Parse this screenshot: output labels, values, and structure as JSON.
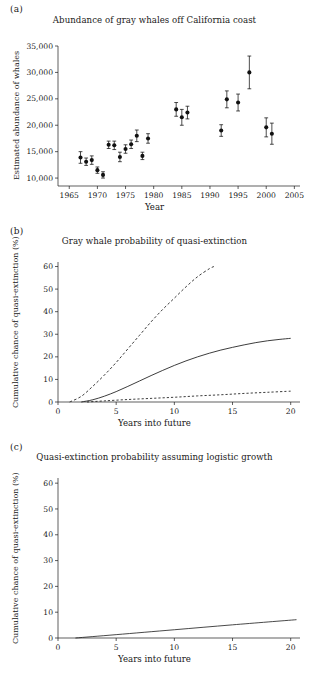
{
  "figure": {
    "panels": [
      {
        "tag": "(a)",
        "title": "Abundance of gray whales off California coast",
        "xlabel": "Year",
        "ylabel": "Estimated abundance of whales"
      },
      {
        "tag": "(b)",
        "title": "Gray whale probability of quasi-extinction",
        "xlabel": "Years into future",
        "ylabel": "Cumulative chance of quasi-extinction (%)"
      },
      {
        "tag": "(c)",
        "title": "Quasi-extinction probability assuming logistic growth",
        "xlabel": "Years into future",
        "ylabel": "Cumulative chance of quasi-extinction (%)"
      }
    ]
  },
  "chart_data": [
    {
      "type": "scatter",
      "panel": "(a)",
      "title": "Abundance of gray whales off California coast",
      "xlabel": "Year",
      "ylabel": "Estimated abundance of whales",
      "xlim": [
        1963,
        2006
      ],
      "ylim": [
        8500,
        35000
      ],
      "xticks": [
        1965,
        1970,
        1975,
        1980,
        1985,
        1990,
        1995,
        2000,
        2005
      ],
      "xticklabels": [
        "1965",
        "1970",
        "1975",
        "1980",
        "1985",
        "1990",
        "1995",
        "2000",
        "2005"
      ],
      "yticks": [
        10000,
        15000,
        20000,
        25000,
        30000,
        35000
      ],
      "yticklabels": [
        "10,000",
        "15,000",
        "20,000",
        "25,000",
        "30,000",
        "35,000"
      ],
      "grid": false,
      "legend": "none",
      "error_bars": "vertical, symmetric (95% CI)",
      "marker": "filled circle",
      "points": [
        {
          "x": 1967,
          "y": 13900,
          "yerr": 1100
        },
        {
          "x": 1968,
          "y": 13100,
          "yerr": 700
        },
        {
          "x": 1969,
          "y": 13400,
          "yerr": 800
        },
        {
          "x": 1970,
          "y": 11500,
          "yerr": 600
        },
        {
          "x": 1971,
          "y": 10600,
          "yerr": 600
        },
        {
          "x": 1972,
          "y": 16300,
          "yerr": 700
        },
        {
          "x": 1973,
          "y": 16200,
          "yerr": 800
        },
        {
          "x": 1974,
          "y": 14000,
          "yerr": 900
        },
        {
          "x": 1975,
          "y": 15500,
          "yerr": 800
        },
        {
          "x": 1976,
          "y": 16400,
          "yerr": 800
        },
        {
          "x": 1977,
          "y": 18000,
          "yerr": 1100
        },
        {
          "x": 1978,
          "y": 14200,
          "yerr": 700
        },
        {
          "x": 1979,
          "y": 17500,
          "yerr": 900
        },
        {
          "x": 1984,
          "y": 23000,
          "yerr": 1300
        },
        {
          "x": 1985,
          "y": 21500,
          "yerr": 1500
        },
        {
          "x": 1986,
          "y": 22400,
          "yerr": 1200
        },
        {
          "x": 1992,
          "y": 19000,
          "yerr": 1100
        },
        {
          "x": 1993,
          "y": 24900,
          "yerr": 1600
        },
        {
          "x": 1995,
          "y": 24300,
          "yerr": 1600
        },
        {
          "x": 1997,
          "y": 30000,
          "yerr": 3100
        },
        {
          "x": 2000,
          "y": 19600,
          "yerr": 1800
        },
        {
          "x": 2001,
          "y": 18400,
          "yerr": 2000
        }
      ]
    },
    {
      "type": "line",
      "panel": "(b)",
      "title": "Gray whale probability of quasi-extinction",
      "xlabel": "Years into future",
      "ylabel": "Cumulative chance of quasi-extinction (%)",
      "xlim": [
        0,
        20.8
      ],
      "ylim": [
        0,
        62
      ],
      "xticks": [
        0,
        5,
        10,
        15,
        20
      ],
      "xticklabels": [
        "0",
        "5",
        "10",
        "15",
        "20"
      ],
      "yticks": [
        0,
        10,
        20,
        30,
        40,
        50,
        60
      ],
      "yticklabels": [
        "0",
        "10",
        "20",
        "30",
        "40",
        "50",
        "60"
      ],
      "grid": false,
      "legend": "none",
      "series": [
        {
          "name": "upper confidence bound",
          "style": "dashed",
          "x": [
            1.0,
            2.0,
            3.0,
            4.0,
            5.0,
            6.0,
            7.0,
            8.0,
            9.0,
            10.0,
            11.0,
            12.0,
            13.0,
            13.4
          ],
          "values": [
            0.0,
            2.5,
            7.0,
            12.0,
            17.5,
            23.5,
            29.5,
            35.5,
            41.0,
            46.0,
            51.0,
            55.5,
            59.0,
            60.0
          ]
        },
        {
          "name": "best estimate",
          "style": "solid",
          "x": [
            2.0,
            3.0,
            4.0,
            5.0,
            6.0,
            7.0,
            8.0,
            9.0,
            10.0,
            11.0,
            12.0,
            13.0,
            14.0,
            15.0,
            16.0,
            17.0,
            18.0,
            19.0,
            20.0
          ],
          "values": [
            0.0,
            1.0,
            2.6,
            4.6,
            6.9,
            9.3,
            11.7,
            14.0,
            16.2,
            18.2,
            20.0,
            21.6,
            23.0,
            24.2,
            25.3,
            26.3,
            27.1,
            27.7,
            28.2
          ]
        },
        {
          "name": "lower confidence bound",
          "style": "dashed",
          "x": [
            2.5,
            4.0,
            6.0,
            8.0,
            10.0,
            12.0,
            14.0,
            16.0,
            18.0,
            20.0
          ],
          "values": [
            0.0,
            0.5,
            1.1,
            1.6,
            2.1,
            2.7,
            3.2,
            3.8,
            4.3,
            4.8
          ]
        }
      ]
    },
    {
      "type": "line",
      "panel": "(c)",
      "title": "Quasi-extinction probability assuming logistic growth",
      "xlabel": "Years into future",
      "ylabel": "Cumulative chance of quasi-extinction (%)",
      "xlim": [
        0,
        20.8
      ],
      "ylim": [
        0,
        62
      ],
      "xticks": [
        0,
        5,
        10,
        15,
        20
      ],
      "xticklabels": [
        "0",
        "5",
        "10",
        "15",
        "20"
      ],
      "yticks": [
        0,
        10,
        20,
        30,
        40,
        50,
        60
      ],
      "yticklabels": [
        "0",
        "10",
        "20",
        "30",
        "40",
        "50",
        "60"
      ],
      "grid": false,
      "legend": "none",
      "series": [
        {
          "name": "logistic growth estimate",
          "style": "solid",
          "x": [
            1.5,
            5.0,
            10.0,
            15.0,
            20.5
          ],
          "values": [
            0.0,
            1.3,
            3.2,
            5.1,
            7.1
          ]
        }
      ]
    }
  ]
}
